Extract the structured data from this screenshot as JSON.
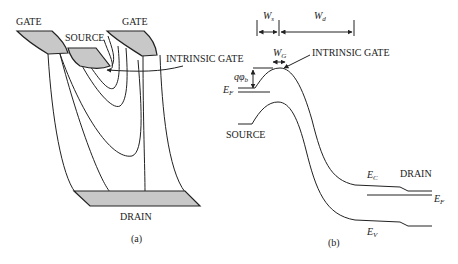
{
  "panel_a": {
    "caption": "(a)",
    "labels": {
      "gate_left": "GATE",
      "gate_right": "GATE",
      "source": "SOURCE",
      "drain": "DRAIN",
      "intrinsic_gate": "INTRINSIC GATE"
    }
  },
  "panel_b": {
    "caption": "(b)",
    "labels": {
      "ws": "W",
      "ws_sub": "s",
      "wd": "W",
      "wd_sub": "d",
      "wg": "W",
      "wg_sub": "G",
      "intrinsic_gate": "INTRINSIC GATE",
      "qphi": "qφ",
      "qphi_sub": "b",
      "ef_left": "E",
      "ef_left_sub": "F",
      "source": "SOURCE",
      "ec": "E",
      "ec_sub": "C",
      "drain": "DRAIN",
      "ef_right": "E",
      "ef_right_sub": "F",
      "ev": "E",
      "ev_sub": "V"
    }
  }
}
